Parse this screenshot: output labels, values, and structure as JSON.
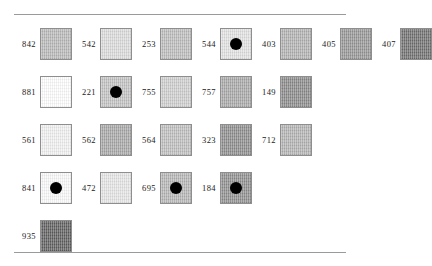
{
  "page": {
    "background_color": "#ffffff",
    "rule_color": "#9a9a9a",
    "swatch_border_color": "#8e8e8e",
    "dot_color": "#000000",
    "label_color": "#1b1b1b"
  },
  "rows": [
    {
      "row_index": 1,
      "cells": [
        {
          "label": "842",
          "color": "#b9b9b9",
          "dot": false
        },
        {
          "label": "542",
          "color": "#dcdcdc",
          "dot": false
        },
        {
          "label": "253",
          "color": "#bdbdbd",
          "dot": false
        },
        {
          "label": "544",
          "color": "#e3e3e3",
          "dot": true
        },
        {
          "label": "403",
          "color": "#b2b2b2",
          "dot": false
        },
        {
          "label": "405",
          "color": "#969696",
          "dot": false
        },
        {
          "label": "407",
          "color": "#6f6f6f",
          "dot": false
        }
      ]
    },
    {
      "row_index": 2,
      "cells": [
        {
          "label": "881",
          "color": "#ffffff",
          "dot": false
        },
        {
          "label": "221",
          "color": "#c3c3c3",
          "dot": true
        },
        {
          "label": "755",
          "color": "#cfcfcf",
          "dot": false
        },
        {
          "label": "757",
          "color": "#a9a9a9",
          "dot": false
        },
        {
          "label": "149",
          "color": "#8a8a8a",
          "dot": false
        }
      ]
    },
    {
      "row_index": 3,
      "cells": [
        {
          "label": "561",
          "color": "#f2f2f2",
          "dot": false
        },
        {
          "label": "562",
          "color": "#a8a8a8",
          "dot": false
        },
        {
          "label": "564",
          "color": "#bfbfbf",
          "dot": false
        },
        {
          "label": "323",
          "color": "#8d8d8d",
          "dot": false
        },
        {
          "label": "712",
          "color": "#b4b4b4",
          "dot": false
        }
      ]
    },
    {
      "row_index": 4,
      "cells": [
        {
          "label": "841",
          "color": "#fbfbfb",
          "dot": true
        },
        {
          "label": "472",
          "color": "#e6e6e6",
          "dot": false
        },
        {
          "label": "695",
          "color": "#b6b6b6",
          "dot": true
        },
        {
          "label": "184",
          "color": "#8f8f8f",
          "dot": true
        }
      ]
    },
    {
      "row_index": 5,
      "cells": [
        {
          "label": "935",
          "color": "#5e5e5e",
          "dot": false
        }
      ]
    }
  ]
}
